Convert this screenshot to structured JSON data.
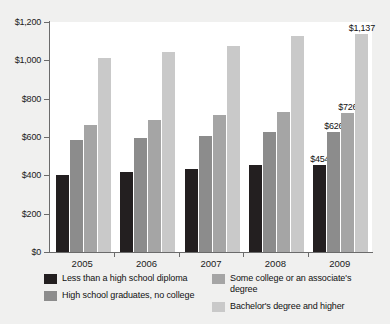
{
  "chart_data": {
    "type": "bar",
    "title": "",
    "xlabel": "",
    "ylabel": "",
    "categories": [
      "2005",
      "2006",
      "2007",
      "2008",
      "2009"
    ],
    "ylim": [
      0,
      1200
    ],
    "ytick_values": [
      0,
      200,
      400,
      600,
      800,
      1000,
      1200
    ],
    "ytick_labels": [
      "$0",
      "$200",
      "$400",
      "$600",
      "$800",
      "$1,000",
      "$1,200"
    ],
    "grid": false,
    "legend_position": "bottom",
    "series": [
      {
        "name": "Less than a high school diploma",
        "color": "#231f20",
        "values": [
          404,
          419,
          433,
          454,
          454
        ],
        "labels": [
          "",
          "",
          "",
          "",
          "$454"
        ]
      },
      {
        "name": "High school graduates, no college",
        "color": "#8c8c8c",
        "values": [
          587,
          595,
          604,
          626,
          626
        ],
        "labels": [
          "",
          "",
          "",
          "",
          "$626"
        ]
      },
      {
        "name": "Some college or an associate's degree",
        "color": "#a5a5a5",
        "values": [
          665,
          690,
          714,
          730,
          726
        ],
        "labels": [
          "",
          "",
          "",
          "",
          "$726"
        ]
      },
      {
        "name": "Bachelor's degree and higher",
        "color": "#c9c9c9",
        "values": [
          1014,
          1044,
          1074,
          1127,
          1137
        ],
        "labels": [
          "",
          "",
          "",
          "",
          "$1,137"
        ]
      }
    ]
  },
  "legend": {
    "items": [
      {
        "label": "Less than a high school diploma",
        "color": "#231f20"
      },
      {
        "label": "High school graduates, no college",
        "color": "#8c8c8c"
      },
      {
        "label": "Some college or an associate's degree",
        "color": "#a5a5a5"
      },
      {
        "label": "Bachelor's degree and higher",
        "color": "#c9c9c9"
      }
    ]
  }
}
